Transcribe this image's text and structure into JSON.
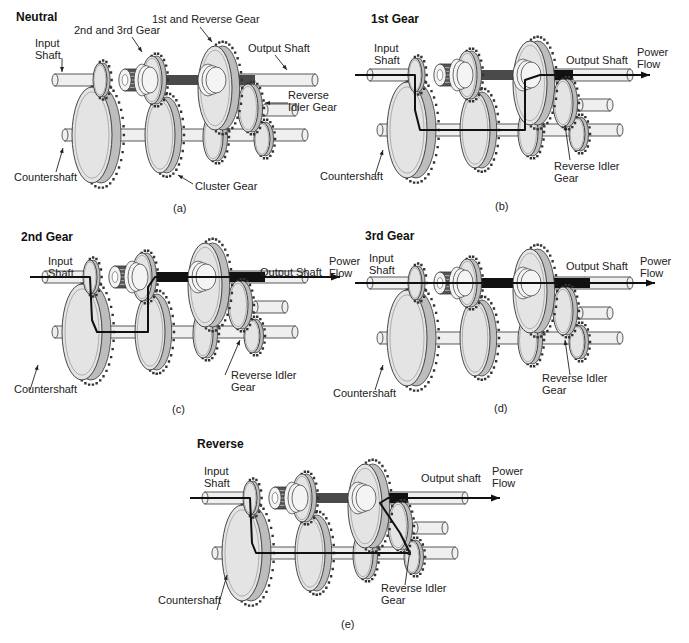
{
  "figure": {
    "colors": {
      "gear_fill": "#e4e4e4",
      "gear_outline": "#333333",
      "shaft_fill": "#efefef",
      "power_flow": "#111111",
      "engaged_shaft": "#222222"
    },
    "panels": [
      {
        "id": "a",
        "title": "Neutral",
        "caption": "(a)",
        "labels": {
          "input_shaft": "Input\nShaft",
          "second_third_gear": "2nd and 3rd Gear",
          "first_reverse_gear": "1st and Reverse Gear",
          "output_shaft": "Output Shaft",
          "reverse_idler": "Reverse\nIdler Gear",
          "countershaft": "Countershaft",
          "cluster_gear": "Cluster Gear"
        }
      },
      {
        "id": "b",
        "title": "1st Gear",
        "caption": "(b)",
        "labels": {
          "input_shaft": "Input\nShaft",
          "output_shaft": "Output Shaft",
          "power_flow": "Power\nFlow",
          "countershaft": "Countershaft",
          "reverse_idler": "Reverse Idler\nGear"
        }
      },
      {
        "id": "c",
        "title": "2nd Gear",
        "caption": "(c)",
        "labels": {
          "input_shaft": "Input\nShaft",
          "output_shaft": "Output Shaft",
          "power_flow": "Power\nFlow",
          "countershaft": "Countershaft",
          "reverse_idler": "Reverse Idler\nGear"
        }
      },
      {
        "id": "d",
        "title": "3rd Gear",
        "caption": "(d)",
        "labels": {
          "input_shaft": "Input\nShaft",
          "output_shaft": "Output Shaft",
          "power_flow": "Power\nFlow",
          "countershaft": "Countershaft",
          "reverse_idler": "Reverse Idler\nGear"
        }
      },
      {
        "id": "e",
        "title": "Reverse",
        "caption": "(e)",
        "labels": {
          "input_shaft": "Input\nShaft",
          "output_shaft": "Output shaft",
          "power_flow": "Power\nFlow",
          "countershaft": "Countershaft",
          "reverse_idler": "Reverse Idler\nGear"
        }
      }
    ]
  }
}
